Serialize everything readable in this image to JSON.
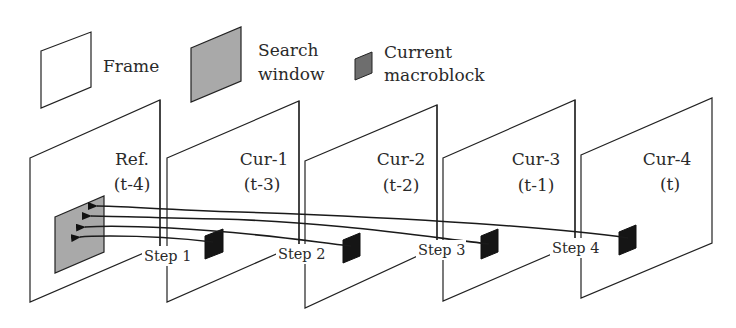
{
  "legend": {
    "frame_label": "Frame",
    "search_window_label_line1": "Search",
    "search_window_label_line2": "window",
    "macroblock_label_line1": "Current",
    "macroblock_label_line2": "macroblock"
  },
  "frames": [
    {
      "name": "Ref.",
      "time": "(t-4)"
    },
    {
      "name": "Cur-1",
      "time": "(t-3)"
    },
    {
      "name": "Cur-2",
      "time": "(t-2)"
    },
    {
      "name": "Cur-3",
      "time": "(t-1)"
    },
    {
      "name": "Cur-4",
      "time": "(t)"
    }
  ],
  "steps": [
    "Step 1",
    "Step 2",
    "Step 3",
    "Step 4"
  ],
  "colors": {
    "search_window_fill": "#a9a9a9",
    "macroblock_fill": "#151515",
    "line": "#222222"
  }
}
